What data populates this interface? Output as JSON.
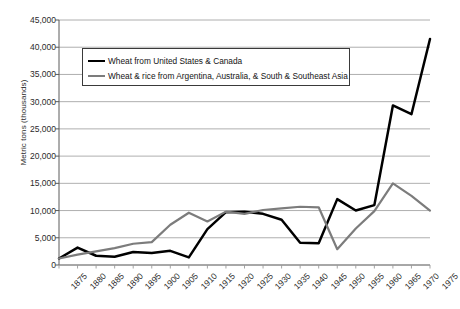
{
  "chart_data": {
    "type": "line",
    "title": "",
    "xlabel": "",
    "ylabel": "Metric tons (thousands)",
    "ylim": [
      0,
      45000
    ],
    "ytick_labels": [
      "45,000",
      "40,000",
      "35,000",
      "30,000",
      "25,000",
      "20,000",
      "15,000",
      "10,000",
      "5,000",
      "0"
    ],
    "ytick_values": [
      45000,
      40000,
      35000,
      30000,
      25000,
      20000,
      15000,
      10000,
      5000,
      0
    ],
    "grid": true,
    "legend_position": "upper-left-inside",
    "categories": [
      "1875",
      "1880",
      "1885",
      "1890",
      "1895",
      "1900",
      "1905",
      "1910",
      "1915",
      "1920",
      "1925",
      "1930",
      "1935",
      "1940",
      "1945",
      "1950",
      "1955",
      "1960",
      "1965",
      "1970",
      "1975"
    ],
    "series": [
      {
        "name": "Wheat from United States & Canada",
        "color": "#000000",
        "values": [
          1200,
          3200,
          1700,
          1500,
          2400,
          2200,
          2600,
          1400,
          6600,
          9700,
          9800,
          9400,
          8300,
          4100,
          4000,
          12100,
          10000,
          11000,
          29300,
          27700,
          41500
        ]
      },
      {
        "name": "Wheat & rice from Argentina, Australia, & South & Southeast Asia",
        "color": "#7c7c7c",
        "values": [
          1200,
          1900,
          2500,
          3100,
          3900,
          4200,
          7400,
          9600,
          8000,
          9800,
          9400,
          10100,
          10400,
          10700,
          10600,
          2900,
          6700,
          9900,
          15000,
          12700,
          10000
        ]
      }
    ]
  },
  "legend": {
    "items": [
      {
        "label": "Wheat from United States & Canada"
      },
      {
        "label": "Wheat & rice from Argentina, Australia, & South & Southeast Asia"
      }
    ]
  }
}
